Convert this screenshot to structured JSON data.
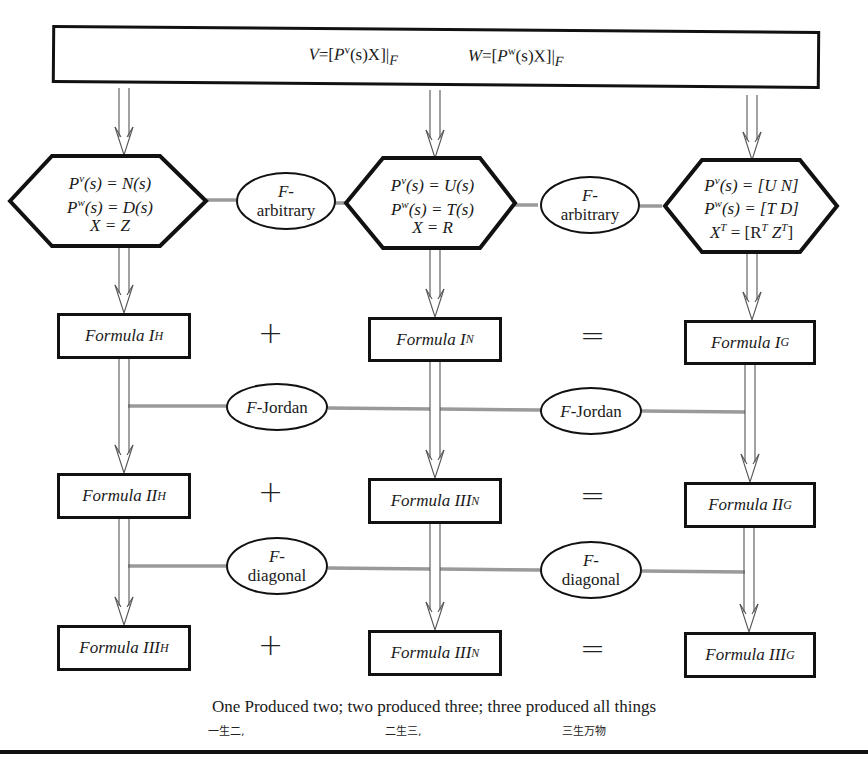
{
  "top": {
    "left_eq": {
      "lhs": "V",
      "P": "P",
      "sup": "v",
      "rest": "(s)X]|",
      "sub": "F"
    },
    "right_eq": {
      "lhs": "W",
      "P": "P",
      "sup": "w",
      "rest": "(s)X]|",
      "sub": "F"
    }
  },
  "hexagons": [
    {
      "lines": [
        [
          "P",
          "v",
          "(s) = N(s)"
        ],
        [
          "P",
          "w",
          "(s) = D(s)"
        ],
        [
          "X = Z"
        ]
      ]
    },
    {
      "lines": [
        [
          "P",
          "v",
          "(s) = U(s)"
        ],
        [
          "P",
          "w",
          "(s) = T(s)"
        ],
        [
          "X = R"
        ]
      ]
    },
    {
      "lines": [
        [
          "P",
          "v",
          "(s) = [U N]"
        ],
        [
          "P",
          "w",
          "(s) = [T D]"
        ],
        [
          "X",
          "T",
          " = [R",
          "T",
          " Z",
          "T",
          "]"
        ]
      ]
    }
  ],
  "ovals": {
    "arbitrary_1": {
      "line1": "F-",
      "line2": "arbitrary"
    },
    "arbitrary_2": {
      "line1": "F-",
      "line2": "arbitrary"
    },
    "jordan_1": {
      "f": "F",
      "rest": "-Jordan"
    },
    "jordan_2": {
      "f": "F",
      "rest": "-Jordan"
    },
    "diagonal_1": {
      "line1": "F-",
      "line2": "diagonal"
    },
    "diagonal_2": {
      "line1": "F-",
      "line2": "diagonal"
    }
  },
  "formulas": {
    "row1": [
      {
        "name": "Formula I",
        "sub": "H"
      },
      {
        "name": "Formula I",
        "sub": "N"
      },
      {
        "name": "Formula I",
        "sub": "G"
      }
    ],
    "row2": [
      {
        "name": "Formula II",
        "sub": "H"
      },
      {
        "name": "Formula III",
        "sub": "N"
      },
      {
        "name": "Formula II",
        "sub": "G"
      }
    ],
    "row3": [
      {
        "name": "Formula III",
        "sub": "H"
      },
      {
        "name": "Formula III",
        "sub": "N"
      },
      {
        "name": "Formula III",
        "sub": "G"
      }
    ]
  },
  "operators": {
    "plus": "+",
    "equals": "="
  },
  "caption": {
    "english": "One Produced two; two produced three; three produced all things",
    "chinese": [
      "一生二,",
      "二生三,",
      "三生万物"
    ]
  },
  "colors": {
    "stroke": "#111111",
    "connector": "#9a9a9a",
    "arrow": "#555555"
  }
}
